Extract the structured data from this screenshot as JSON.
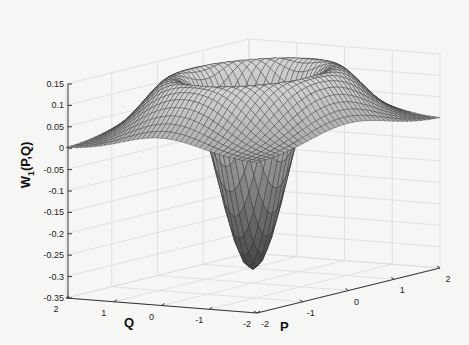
{
  "chart_data": {
    "type": "surface3d",
    "title": "",
    "xlabel": "P",
    "ylabel": "Q",
    "zlabel": "W_1(P,Q)",
    "zlabel_main": "W",
    "zlabel_sub": "1",
    "zlabel_rest": "(P,Q)",
    "xlim": [
      -2,
      2
    ],
    "ylim": [
      -2,
      2
    ],
    "zlim": [
      -0.35,
      0.15
    ],
    "x_ticks": [
      "-2",
      "-1",
      "0",
      "1",
      "2"
    ],
    "y_ticks": [
      "2",
      "1",
      "0",
      "-1",
      "-2"
    ],
    "z_ticks": [
      "0.15",
      "0.1",
      "0.05",
      "0",
      "-0.05",
      "-0.1",
      "-0.15",
      "-0.2",
      "-0.25",
      "-0.3",
      "-0.35"
    ],
    "z_tick_values": [
      0.15,
      0.1,
      0.05,
      0,
      -0.05,
      -0.1,
      -0.15,
      -0.2,
      -0.25,
      -0.3,
      -0.35
    ],
    "grid": true,
    "function": "W1(P,Q) = (2(P^2+Q^2) - 1) * exp(-(P^2+Q^2)) / pi",
    "min_value": -0.318,
    "max_value": 0.142,
    "max_radius": 1.22,
    "mesh_n": 41,
    "colormap": "gray"
  }
}
